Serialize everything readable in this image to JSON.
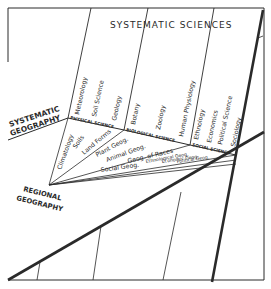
{
  "diagram": {
    "title": "SYSTEMATIC SCIENCES",
    "left_label": [
      "SYSTEMATIC",
      "GEOGRAPHY"
    ],
    "bottom_label": [
      "REGIONAL",
      "GEOGRAPHY"
    ],
    "groups": [
      {
        "name": "PHYSICAL SCIENCE",
        "sciences": [
          "Meteorology",
          "Soil Science",
          "Geology"
        ]
      },
      {
        "name": "BIOLOGICAL SCIENCE",
        "sciences": [
          "Botany",
          "Zoology",
          "Human Physiology"
        ]
      },
      {
        "name": "SOCIAL SCIENCE",
        "sciences": [
          "Ethnology",
          "Economics",
          "Political Science",
          "Sociology"
        ]
      }
    ],
    "geographies": [
      "Climatology",
      "Soils",
      "Land Forms",
      "Plant Geog.",
      "Animal Geog.",
      "Geog. of Races",
      "Ethnological Geog.",
      "Economic Geog.",
      "Political Geog.",
      "Social Geog."
    ],
    "colors": {
      "ink": "#2a2a2a",
      "background": "#ffffff"
    }
  }
}
